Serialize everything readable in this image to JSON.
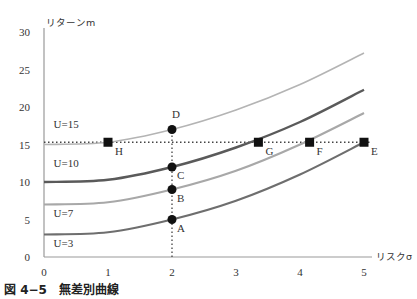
{
  "caption": "図 4−5　無差別曲線",
  "chart_data": {
    "type": "line",
    "title": "無差別曲線",
    "figure_label": "図 4−5",
    "xlabel": "リスクσ",
    "ylabel": "リターンm",
    "xlim": [
      0,
      5
    ],
    "ylim": [
      0,
      30
    ],
    "xticks": [
      0,
      1,
      2,
      3,
      4,
      5
    ],
    "yticks": [
      0,
      5,
      10,
      15,
      20,
      25,
      30
    ],
    "grid": false,
    "legend": "none",
    "series": [
      {
        "name": "U=3",
        "color": "#6e6e6e",
        "width": 2.2,
        "x": [
          0,
          1,
          2,
          3,
          4,
          5
        ],
        "y": [
          3.0,
          3.3,
          5.0,
          7.5,
          11.0,
          15.3
        ]
      },
      {
        "name": "U=7",
        "color": "#a8a8a8",
        "width": 2.2,
        "x": [
          0,
          1,
          2,
          3,
          4,
          5
        ],
        "y": [
          7.0,
          7.3,
          9.0,
          11.5,
          15.0,
          19.2
        ]
      },
      {
        "name": "U=10",
        "color": "#5a5a5a",
        "width": 2.4,
        "x": [
          0,
          1,
          2,
          3,
          4,
          5
        ],
        "y": [
          10.0,
          10.3,
          12.0,
          14.6,
          18.0,
          22.3
        ]
      },
      {
        "name": "U=15",
        "color": "#b4b4b4",
        "width": 1.6,
        "x": [
          0,
          1,
          2,
          3,
          4,
          5
        ],
        "y": [
          15.0,
          15.3,
          17.0,
          19.6,
          23.0,
          27.2
        ]
      }
    ],
    "curve_labels": [
      {
        "text": "U=15",
        "x": 0.15,
        "y": 17.2
      },
      {
        "text": "U=10",
        "x": 0.15,
        "y": 12.0
      },
      {
        "text": "U=7",
        "x": 0.15,
        "y": 5.3
      },
      {
        "text": "U=3",
        "x": 0.15,
        "y": 1.3
      }
    ],
    "points_circle": [
      {
        "label": "A",
        "x": 2,
        "y": 5.0
      },
      {
        "label": "B",
        "x": 2,
        "y": 9.0
      },
      {
        "label": "C",
        "x": 2,
        "y": 12.0
      },
      {
        "label": "D",
        "x": 2,
        "y": 17.0
      }
    ],
    "points_square": [
      {
        "label": "H",
        "x": 1.0,
        "y": 15.3
      },
      {
        "label": "G",
        "x": 3.35,
        "y": 15.3
      },
      {
        "label": "F",
        "x": 4.15,
        "y": 15.3
      },
      {
        "label": "E",
        "x": 5.0,
        "y": 15.3
      }
    ],
    "reference_lines": [
      {
        "orientation": "horizontal",
        "y": 15.3,
        "style": "dotted"
      },
      {
        "orientation": "vertical",
        "x": 2,
        "from": 0,
        "to": 17,
        "style": "dotted"
      }
    ]
  }
}
